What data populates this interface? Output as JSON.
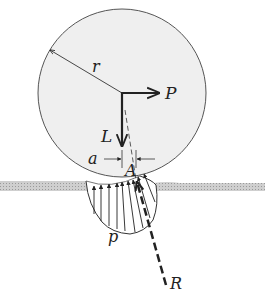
{
  "diagram": {
    "labels": {
      "radius": "r",
      "force_P": "P",
      "load_L": "L",
      "offset_a": "a",
      "point_A": "A",
      "pressure_p": "p",
      "resultant_R": "R"
    },
    "colors": {
      "wheel_fill": "#efefef",
      "wheel_stroke": "#555555",
      "ground": "#bdbdbd",
      "ink": "#222222"
    }
  }
}
